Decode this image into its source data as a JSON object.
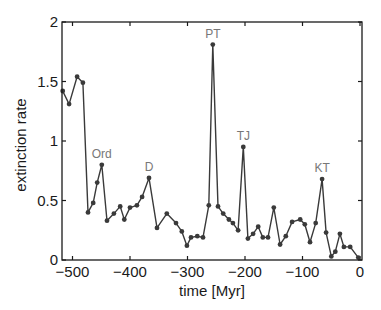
{
  "chart_data": {
    "type": "line",
    "title": "",
    "xlabel": "time [Myr]",
    "ylabel": "extinction rate",
    "xlim": [
      -520,
      0
    ],
    "ylim": [
      0,
      2
    ],
    "grid": false,
    "xticks": [
      -500,
      -400,
      -300,
      -200,
      -100,
      0
    ],
    "xtick_labels": [
      "−500",
      "−400",
      "−300",
      "−200",
      "−100",
      "0"
    ],
    "yticks": [
      0,
      0.5,
      1,
      1.5,
      2
    ],
    "ytick_labels": [
      "0",
      "0.5",
      "1",
      "1.5",
      "2"
    ],
    "series": [
      {
        "name": "extinction rate",
        "color": "#3a3a3a",
        "x": [
          -517,
          -506,
          -492,
          -482,
          -473,
          -464,
          -457,
          -449,
          -440,
          -428,
          -417,
          -410,
          -400,
          -388,
          -379,
          -367,
          -353,
          -336,
          -320,
          -310,
          -301,
          -294,
          -283,
          -273,
          -263,
          -256,
          -247,
          -238,
          -228,
          -221,
          -212,
          -203,
          -195,
          -186,
          -177,
          -169,
          -160,
          -150,
          -139,
          -129,
          -118,
          -104,
          -96,
          -87,
          -77,
          -66,
          -59,
          -50,
          -43,
          -35,
          -28,
          -17,
          -3
        ],
        "y": [
          1.42,
          1.31,
          1.54,
          1.49,
          0.4,
          0.48,
          0.65,
          0.8,
          0.33,
          0.39,
          0.45,
          0.34,
          0.44,
          0.46,
          0.53,
          0.69,
          0.27,
          0.39,
          0.31,
          0.24,
          0.12,
          0.19,
          0.2,
          0.19,
          0.46,
          1.81,
          0.45,
          0.39,
          0.34,
          0.31,
          0.25,
          0.95,
          0.18,
          0.22,
          0.28,
          0.19,
          0.19,
          0.44,
          0.13,
          0.2,
          0.32,
          0.34,
          0.3,
          0.15,
          0.31,
          0.68,
          0.23,
          0.03,
          0.07,
          0.22,
          0.11,
          0.11,
          0.02
        ]
      }
    ],
    "annotations": [
      {
        "text": "Ord",
        "x": -449,
        "y": 0.8
      },
      {
        "text": "D",
        "x": -367,
        "y": 0.69
      },
      {
        "text": "PT",
        "x": -256,
        "y": 1.81
      },
      {
        "text": "TJ",
        "x": -203,
        "y": 0.95
      },
      {
        "text": "KT",
        "x": -66,
        "y": 0.68
      }
    ],
    "legend": "none"
  }
}
